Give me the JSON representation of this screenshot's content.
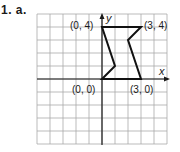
{
  "problem": {
    "label": "1. a."
  },
  "grid": {
    "origin_px": [
      102,
      79
    ],
    "unit_px": 13,
    "x_range": [
      -5,
      5
    ],
    "y_range": [
      -5,
      5
    ],
    "grid_color": "#aaaaaa",
    "axis_color": "#1a1a1a",
    "shape_color": "#111111"
  },
  "axes": {
    "x_label": "x",
    "y_label": "y"
  },
  "shape": {
    "vertices": [
      [
        0,
        4
      ],
      [
        3,
        4
      ],
      [
        2,
        3
      ],
      [
        3,
        0
      ],
      [
        0,
        0
      ],
      [
        1,
        1
      ]
    ]
  },
  "labels": {
    "p04": "(0, 4)",
    "p34": "(3, 4)",
    "p00": "(0, 0)",
    "p30": "(3, 0)"
  }
}
